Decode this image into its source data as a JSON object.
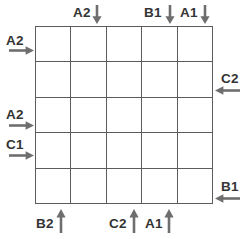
{
  "diagram": {
    "grid": {
      "rows": 5,
      "columns": 5,
      "line_color": "#5c5c5c",
      "cell_fill": "#ffffff",
      "cells": [
        [
          "",
          "",
          "",
          "",
          ""
        ],
        [
          "",
          "",
          "",
          "",
          ""
        ],
        [
          "",
          "",
          "",
          "",
          ""
        ],
        [
          "",
          "",
          "",
          "",
          ""
        ],
        [
          "",
          "",
          "",
          "",
          ""
        ]
      ]
    },
    "label_color": "#343434",
    "arrow_color": "#6e6e6e",
    "arrows": {
      "top": [
        {
          "label": "A2",
          "direction": "down",
          "column": 2
        },
        {
          "label": "B1",
          "direction": "down",
          "column": 4
        },
        {
          "label": "A1",
          "direction": "down",
          "column": 5
        }
      ],
      "left": [
        {
          "label": "A2",
          "direction": "right",
          "row": 1
        },
        {
          "label": "A2",
          "direction": "right",
          "row": 3
        },
        {
          "label": "C1",
          "direction": "right",
          "row": 4
        }
      ],
      "right": [
        {
          "label": "C2",
          "direction": "left",
          "row": 2
        },
        {
          "label": "B1",
          "direction": "left",
          "row": 5
        }
      ],
      "bottom": [
        {
          "label": "B2",
          "direction": "up",
          "column": 1
        },
        {
          "label": "C2",
          "direction": "up",
          "column": 3
        },
        {
          "label": "A1",
          "direction": "up",
          "column": 4
        }
      ]
    }
  }
}
